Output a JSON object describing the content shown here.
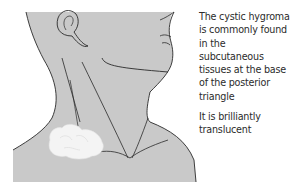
{
  "figure": {
    "skin_color": "#c9c9c9",
    "outline_color": "#2a2a2a",
    "lesion_color": "#f4f4f4"
  },
  "caption": {
    "paragraphs": [
      "The cystic hygroma is commonly found in the subcutaneous tissues at the base of the posterior triangle",
      "It is brilliantly translucent"
    ]
  }
}
